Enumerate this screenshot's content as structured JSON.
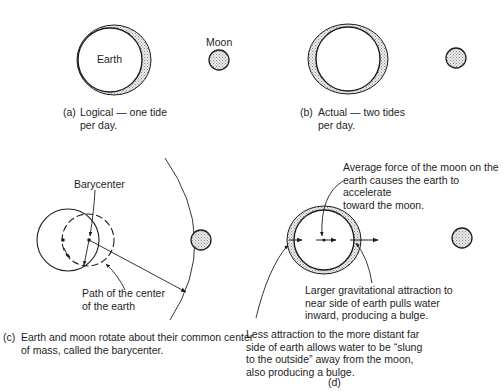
{
  "panels": {
    "a": {
      "earth_label": "Earth",
      "moon_label": "Moon",
      "caption_tag": "(a)",
      "caption": "Logical — one tide\nper day."
    },
    "b": {
      "caption_tag": "(b)",
      "caption": "Actual — two tides\nper day."
    },
    "c": {
      "barycenter_label": "Barycenter",
      "path_label": "Path of the center\nof the earth",
      "caption_tag": "(c)",
      "caption": "Earth and moon rotate about their common center\nof mass, called the barycenter."
    },
    "d": {
      "average_force_note": "Average force of the moon on the\nearth causes the earth to accelerate\ntoward the moon.",
      "near_side_note": "Larger gravitational attraction to\nnear side of earth pulls water\ninward, producing a bulge.",
      "far_side_note": "Less attraction to the more distant far\nside of earth allows water to be “slung\nto the outside” away from the moon,\nalso producing a bulge.",
      "caption": "(d)"
    }
  },
  "colors": {
    "ink": "#1e1e1e",
    "water_fill": "#cfcfcf",
    "moon_fill": "#d4d4d4"
  }
}
